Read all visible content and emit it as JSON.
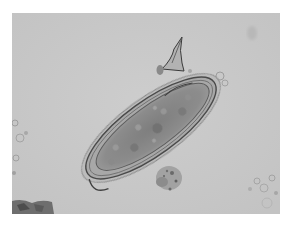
{
  "image": {
    "subject": "microscopy-egg-with-spine",
    "description": "Grayscale light-microscopy image of an elongated oval egg with a sharp spine near one end, surrounded by background debris",
    "colors": {
      "page_background": "#ffffff",
      "field_background": "#c9c9c9",
      "egg_shell": "#5a5a5a",
      "egg_interior": "#8c8c8c",
      "egg_inner_dark": "#7a7a7a",
      "debris": "#9a9a9a"
    }
  }
}
